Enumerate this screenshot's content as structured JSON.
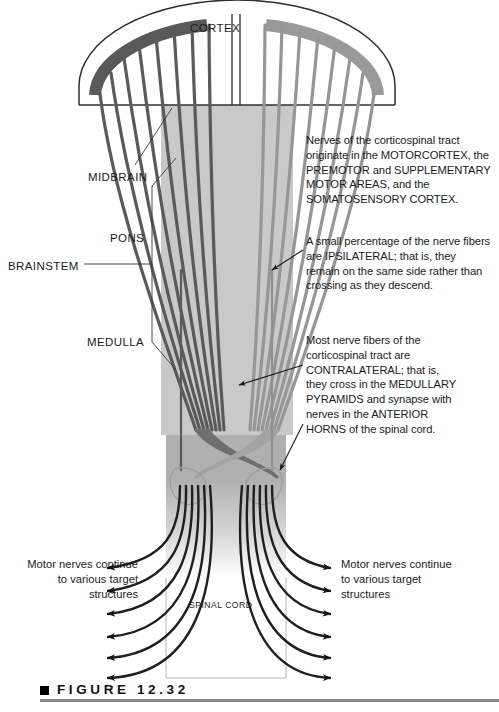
{
  "figure": {
    "caption_label": "FIGURE  12.32",
    "domain_subject": "Corticospinal tract diagram"
  },
  "labels": {
    "cortex": "CORTEX",
    "midbrain": "MIDBRAIN",
    "pons": "PONS",
    "medulla": "MEDULLA",
    "brainstem": "BRAINSTEM",
    "spinal_cord": "SPINAL CORD"
  },
  "annotations": {
    "origin": "Nerves of the corticospinal tract originate in the MOTORCORTEX, the PREMOTOR and SUPPLEMENTARY MOTOR AREAS, and the SOMATOSENSORY CORTEX.",
    "ipsilateral": "A small percentage of the nerve fibers are IPSILATERAL; that is, they remain on the same side rather than crossing as they descend.",
    "contralateral": "Most nerve fibers of the corticospinal tract are CONTRALATERAL; that is, they cross in the MEDULLARY PYRAMIDS and synapse with nerves in the ANTERIOR HORNS of the spinal cord."
  },
  "motor_notes": {
    "left": "Motor nerves continue to various target structures",
    "right": "Motor nerves continue to various target structures"
  },
  "colors": {
    "fiber_left": "#5a5a5a",
    "fiber_right": "#969696",
    "cortex_band_left": "#595959",
    "cortex_band_right": "#9a9a9a",
    "brainstem_fill": "#c9c9c9",
    "medulla_fill": "#b4b4b4",
    "outline": "#3c3c3c",
    "caption_rule": "#8a8a8a",
    "text": "#1b1b1b"
  }
}
